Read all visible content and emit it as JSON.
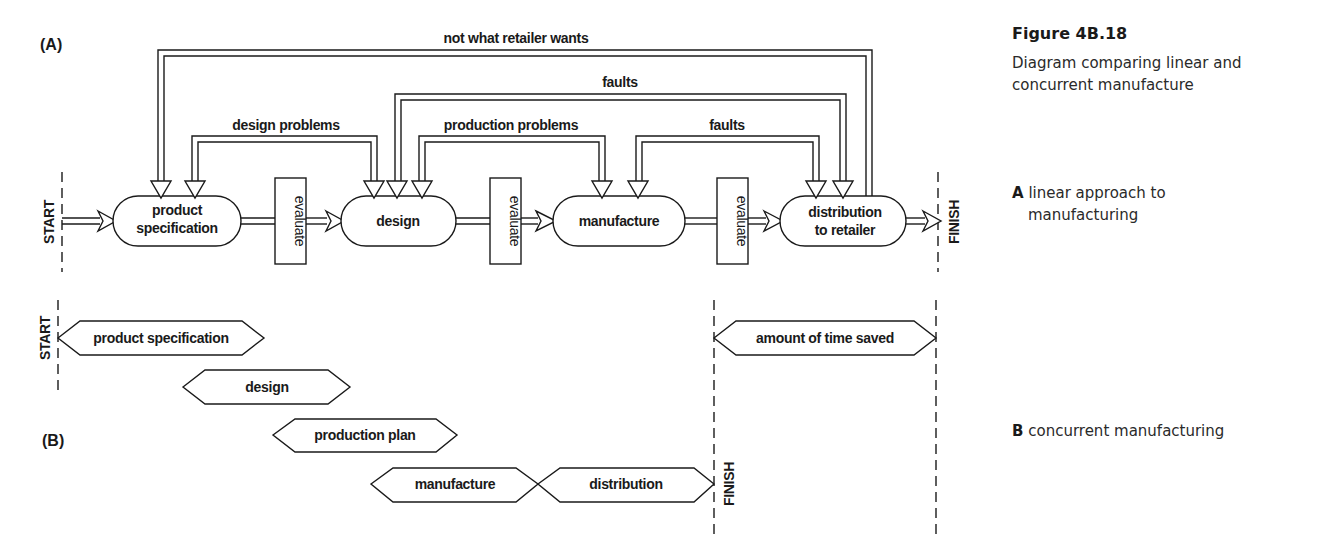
{
  "figure": {
    "title": "Figure 4B.18",
    "description": "Diagram comparing linear and concurrent manufacture",
    "parts": [
      {
        "letter": "A",
        "text": "linear approach to",
        "text2": "manufacturing"
      },
      {
        "letter": "B",
        "text": "concurrent manufacturing"
      }
    ]
  },
  "diagram_a": {
    "label": "(A)",
    "start": "START",
    "finish": "FINISH",
    "stages": [
      {
        "line1": "product",
        "line2": "specification"
      },
      {
        "line1": "design"
      },
      {
        "line1": "manufacture"
      },
      {
        "line1": "distribution",
        "line2": "to retailer"
      }
    ],
    "evaluate": "evaluate",
    "feedback": {
      "not_what_retailer_wants": "not what retailer wants",
      "faults_long": "faults",
      "design_problems": "design problems",
      "production_problems": "production problems",
      "faults_short": "faults"
    }
  },
  "diagram_b": {
    "label": "(B)",
    "start": "START",
    "finish": "FINISH",
    "bars": [
      "product specification",
      "design",
      "production plan",
      "manufacture",
      "distribution"
    ],
    "time_saved": "amount of time saved"
  }
}
